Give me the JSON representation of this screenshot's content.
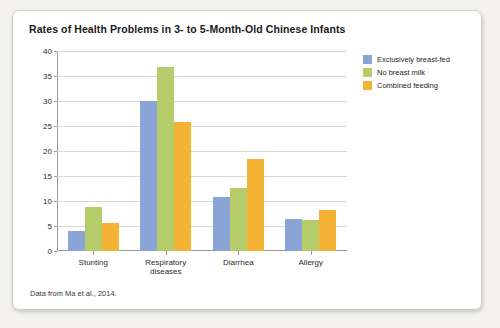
{
  "card": {
    "title": "Rates of Health Problems in 3- to 5-Month-Old Chinese Infants",
    "source": "Data from Ma et al., 2014."
  },
  "legend": {
    "items": [
      {
        "label": "Exclusively breast-fed",
        "color": "#8aa4d6"
      },
      {
        "label": "No breast milk",
        "color": "#b5cc6a"
      },
      {
        "label": "Combined feeding",
        "color": "#f5b335"
      }
    ]
  },
  "chart_data": {
    "type": "bar",
    "title": "Rates of Health Problems in 3- to 5-Month-Old Chinese Infants",
    "xlabel": "",
    "ylabel": "",
    "ylim": [
      0,
      40
    ],
    "yticks": [
      0,
      5,
      10,
      15,
      20,
      25,
      30,
      35,
      40
    ],
    "grid": true,
    "legend_position": "right",
    "categories": [
      "Stunting",
      "Respiratory\ndiseases",
      "Diarrhea",
      "Allergy"
    ],
    "series": [
      {
        "name": "Exclusively breast-fed",
        "color": "#8aa4d6",
        "values": [
          4.0,
          30.0,
          10.8,
          6.4
        ]
      },
      {
        "name": "No breast milk",
        "color": "#b5cc6a",
        "values": [
          8.8,
          36.8,
          12.7,
          6.3
        ]
      },
      {
        "name": "Combined feeding",
        "color": "#f5b335",
        "values": [
          5.7,
          25.8,
          18.5,
          8.3
        ]
      }
    ],
    "annotation": "Data from Ma et al., 2014."
  }
}
